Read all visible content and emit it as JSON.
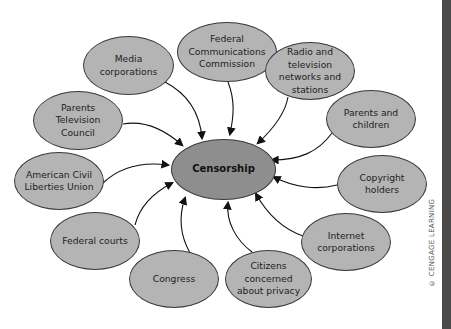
{
  "diagram": {
    "center": {
      "label": "Censorship"
    },
    "nodes": [
      {
        "id": "media",
        "label": "Media corporations"
      },
      {
        "id": "fcc",
        "label": "Federal Communications Commission"
      },
      {
        "id": "radio_tv",
        "label": "Radio and television networks and stations"
      },
      {
        "id": "parents_children",
        "label": "Parents and children"
      },
      {
        "id": "copyright",
        "label": "Copyright holders"
      },
      {
        "id": "internet",
        "label": "Internet corporations"
      },
      {
        "id": "citizens",
        "label": "Citizens concerned about privacy"
      },
      {
        "id": "congress",
        "label": "Congress"
      },
      {
        "id": "federal_courts",
        "label": "Federal courts"
      },
      {
        "id": "aclu",
        "label": "American Civil Liberties Union"
      },
      {
        "id": "ptc",
        "label": "Parents Television Council"
      }
    ],
    "edge_direction": "all nodes point to center"
  },
  "credit": "© CENGAGE LEARNING"
}
